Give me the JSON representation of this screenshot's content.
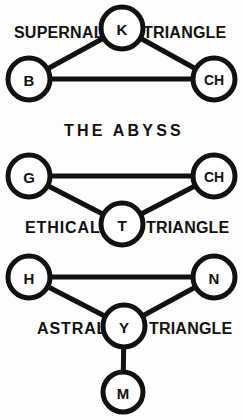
{
  "diagram": {
    "background_color": "#fdfdfb",
    "ink_color": "#111111",
    "abyss_label": "THE ABYSS",
    "groups": [
      {
        "id": "supernal",
        "left_label": "SUPERNAL",
        "right_label": "TRIANGLE",
        "nodes": [
          {
            "id": "k",
            "label": "K",
            "cx": 122,
            "cy": 28,
            "r": 21
          },
          {
            "id": "b",
            "label": "B",
            "cx": 29,
            "cy": 79,
            "r": 21
          },
          {
            "id": "ch1",
            "label": "CH",
            "cx": 214,
            "cy": 79,
            "r": 21
          }
        ],
        "edges": [
          {
            "from": "b",
            "to": "k"
          },
          {
            "from": "k",
            "to": "ch1"
          },
          {
            "from": "b",
            "to": "ch1"
          }
        ]
      },
      {
        "id": "ethical",
        "left_label": "ETHICAL",
        "right_label": "TRIANGLE",
        "nodes": [
          {
            "id": "g",
            "label": "G",
            "cx": 29,
            "cy": 176,
            "r": 21
          },
          {
            "id": "ch2",
            "label": "CH",
            "cx": 214,
            "cy": 176,
            "r": 21
          },
          {
            "id": "t",
            "label": "T",
            "cx": 122,
            "cy": 224,
            "r": 21
          }
        ],
        "edges": [
          {
            "from": "g",
            "to": "ch2"
          },
          {
            "from": "g",
            "to": "t"
          },
          {
            "from": "t",
            "to": "ch2"
          }
        ]
      },
      {
        "id": "astral",
        "left_label": "ASTRAL",
        "right_label": "TRIANGLE",
        "nodes": [
          {
            "id": "h",
            "label": "H",
            "cx": 29,
            "cy": 277,
            "r": 21
          },
          {
            "id": "n",
            "label": "N",
            "cx": 214,
            "cy": 277,
            "r": 21
          },
          {
            "id": "y",
            "label": "Y",
            "cx": 124,
            "cy": 326,
            "r": 21
          },
          {
            "id": "m",
            "label": "M",
            "cx": 123,
            "cy": 392,
            "r": 20
          }
        ],
        "edges": [
          {
            "from": "h",
            "to": "n"
          },
          {
            "from": "h",
            "to": "y"
          },
          {
            "from": "y",
            "to": "n"
          },
          {
            "from": "y",
            "to": "m"
          }
        ]
      }
    ],
    "text_positions": {
      "supernal_left": {
        "x": 14,
        "y": 38
      },
      "supernal_right": {
        "x": 143,
        "y": 38
      },
      "abyss": {
        "x": 122,
        "y": 136
      },
      "ethical_left": {
        "x": 25,
        "y": 233
      },
      "ethical_right": {
        "x": 146,
        "y": 233
      },
      "astral_left": {
        "x": 37,
        "y": 334
      },
      "astral_right": {
        "x": 149,
        "y": 334
      }
    }
  }
}
